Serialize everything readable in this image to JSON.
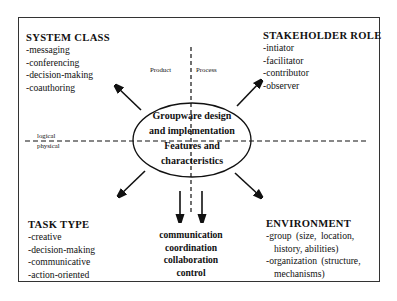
{
  "diagram": {
    "center": {
      "lines": [
        "Groupware design",
        "and implementation",
        "Features and",
        "characteristics"
      ]
    },
    "axes": {
      "vertical_left_label": "Product",
      "vertical_right_label": "Process",
      "horizontal_top_label": "logical",
      "horizontal_bottom_label": "physical"
    },
    "system_class": {
      "title": "SYSTEM CLASS",
      "items": [
        "-messaging",
        "-conferencing",
        "-decision-making",
        "-coauthoring"
      ]
    },
    "stakeholder_role": {
      "title": "STAKEHOLDER ROLE",
      "items": [
        "-intiator",
        "-facilitator",
        "-contributor",
        "-observer"
      ]
    },
    "task_type": {
      "title": "TASK TYPE",
      "items": [
        "-creative",
        "-decision-making",
        "-communicative",
        "-action-oriented"
      ]
    },
    "environment": {
      "title": "ENVIRONMENT",
      "items": [
        "-group (size, location,",
        "history, abilities)",
        "-organization (structure,",
        "mechanisms)"
      ]
    },
    "outcomes": {
      "items": [
        "communication",
        "coordination",
        "collaboration",
        "control"
      ]
    },
    "colors": {
      "stroke": "#111111",
      "frame": "#333333",
      "background": "#ffffff"
    }
  }
}
